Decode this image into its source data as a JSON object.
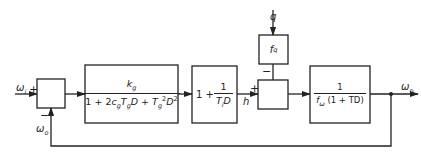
{
  "diagram": {
    "type": "control-loop-block-diagram",
    "signals": {
      "input": "ω",
      "input_sub": "i",
      "output": "ω",
      "output_sub": "o",
      "feedback": "ω",
      "feedback_sub": "o",
      "intermediate": "h",
      "disturbance": "q"
    },
    "summers": [
      {
        "id": "summer-1",
        "plus": "+",
        "minus": "−"
      },
      {
        "id": "summer-2",
        "plus": "+",
        "minus": "−"
      }
    ],
    "blocks": {
      "governor": {
        "num_k": "k",
        "num_k_sub": "g",
        "den_prefix": "1 + 2",
        "den_c": "c",
        "den_c_sub": "g",
        "den_T": "T",
        "den_T_sub": "g",
        "den_D": "D",
        "den_plus": " + ",
        "den_T2": "T",
        "den_T2_sub": "g",
        "den_T2_sup": "2",
        "den_D2": "D",
        "den_D2_sup": "2"
      },
      "integrator": {
        "prefix": "1 + ",
        "num": "1",
        "den_T": "T",
        "den_T_sub": "i",
        "den_D": "D"
      },
      "disturbance_gain": {
        "f": "f",
        "f_sub": "q"
      },
      "plant": {
        "num": "1",
        "den_f": "f",
        "den_f_sub": "ω",
        "den_rest": " (1 + TD)"
      }
    }
  }
}
